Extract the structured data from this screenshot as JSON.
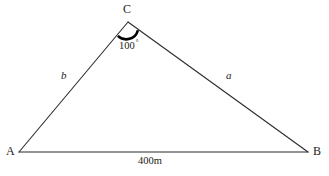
{
  "figure": {
    "type": "triangle-diagram",
    "background_color": "#ffffff",
    "stroke_color": "#2b2b2b",
    "arc_color": "#000000",
    "text_color": "#1a1a1a"
  },
  "vertices": {
    "a": {
      "label": "A",
      "x": 19,
      "y": 152,
      "label_x": 6,
      "label_y": 147
    },
    "b": {
      "label": "B",
      "x": 308,
      "y": 152,
      "label_x": 313,
      "label_y": 147
    },
    "c": {
      "label": "C",
      "x": 128,
      "y": 22,
      "label_x": 124,
      "label_y": 4
    }
  },
  "sides": {
    "left": {
      "label": "b",
      "label_x": 61,
      "label_y": 71
    },
    "right": {
      "label": "a",
      "label_x": 226,
      "label_y": 71
    },
    "base": {
      "label": "400m",
      "label_x": 138,
      "label_y": 157
    }
  },
  "angle": {
    "vertex": "C",
    "value": "100",
    "degree_symbol": "°",
    "label_x": 119,
    "label_y": 40,
    "arc_radius": 12
  }
}
